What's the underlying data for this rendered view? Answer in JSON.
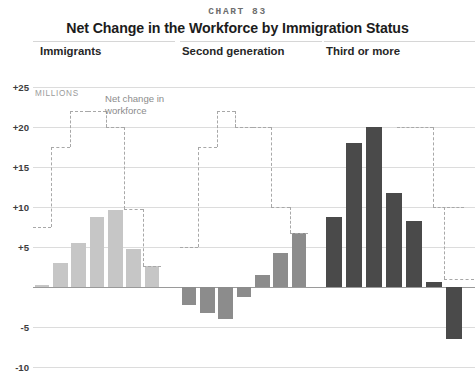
{
  "header": {
    "chart_number": "CHART 83",
    "title": "Net Change in the Workforce by Immigration Status"
  },
  "units_label": "MILLIONS",
  "annotation": {
    "line1": "Net change in",
    "line2": "workforce"
  },
  "axis": {
    "ticks": [
      "+25",
      "+20",
      "+15",
      "+10",
      "+5",
      "-5",
      "-10"
    ],
    "tick_values": [
      25,
      20,
      15,
      10,
      5,
      -5,
      -10
    ]
  },
  "colors": {
    "panel1_bar": "#c6c6c6",
    "panel2_bar": "#8c8c8c",
    "panel3_bar": "#4a4a4a",
    "gridline": "#dcdcdc",
    "zeroline": "#9a9a9a",
    "stepline": "#a8a8a8",
    "title": "#1c1c1c",
    "units": "#9b9b9b"
  },
  "chart_data": {
    "type": "bar",
    "title": "Net Change in the Workforce by Immigration Status",
    "subtitle": "CHART 83",
    "xlabel": "",
    "ylabel": "MILLIONS",
    "ylim": [
      -11,
      26
    ],
    "grid": true,
    "legend_position": "inline-annotation",
    "ytick_labels": [
      "+25",
      "+20",
      "+15",
      "+10",
      "+5",
      "-5",
      "-10"
    ],
    "ytick_values": [
      25,
      20,
      15,
      10,
      5,
      -5,
      -10
    ],
    "panels": [
      {
        "name": "Immigrants",
        "bar_color": "#c6c6c6",
        "values": [
          0.3,
          3.0,
          5.5,
          8.8,
          9.6,
          4.7,
          2.6
        ],
        "step_line": {
          "name": "Net change in workforce",
          "values": [
            7.5,
            17.5,
            22.0,
            22.0,
            20.0,
            9.8,
            2.6
          ]
        }
      },
      {
        "name": "Second generation",
        "bar_color": "#8c8c8c",
        "values": [
          -2.2,
          -3.3,
          -4.0,
          -1.3,
          1.5,
          4.2,
          6.8
        ],
        "step_line": {
          "name": "Net change in workforce",
          "values": [
            5.0,
            17.5,
            22.0,
            20.0,
            20.0,
            10.0,
            6.8
          ]
        }
      },
      {
        "name": "Third or more",
        "bar_color": "#4a4a4a",
        "values": [
          8.8,
          18.0,
          20.0,
          11.7,
          8.2,
          0.6,
          -6.5
        ]
      }
    ]
  }
}
